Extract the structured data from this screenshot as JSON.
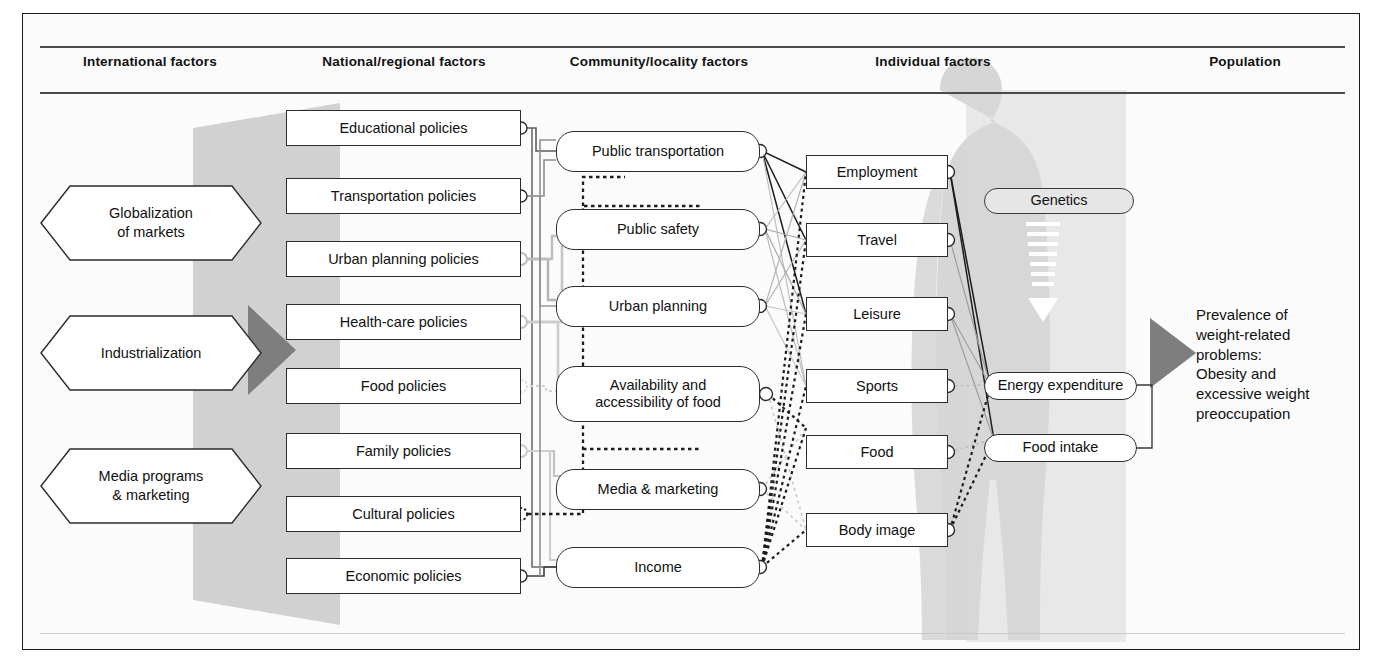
{
  "figure": {
    "type": "flow-diagram"
  },
  "columns": [
    {
      "key": "international",
      "label": "International factors",
      "x": 150
    },
    {
      "key": "national",
      "label": "National/regional factors",
      "x": 404
    },
    {
      "key": "community",
      "label": "Community/locality factors",
      "x": 659
    },
    {
      "key": "individual",
      "label": "Individual factors",
      "x": 933
    },
    {
      "key": "population",
      "label": "Population",
      "x": 1245
    }
  ],
  "international_factors": [
    {
      "label": "Globalization\nof markets",
      "line1": "Globalization",
      "line2": "of markets"
    },
    {
      "label": "Industrialization",
      "line1": "Industrialization",
      "line2": ""
    },
    {
      "label": "Media programs\n& marketing",
      "line1": "Media programs",
      "line2": "& marketing"
    }
  ],
  "national_factors": [
    {
      "label": "Educational policies"
    },
    {
      "label": "Transportation policies"
    },
    {
      "label": "Urban planning policies"
    },
    {
      "label": "Health-care policies"
    },
    {
      "label": "Food policies"
    },
    {
      "label": "Family policies"
    },
    {
      "label": "Cultural policies"
    },
    {
      "label": "Economic policies"
    }
  ],
  "community_factors": [
    {
      "label": "Public transportation",
      "line1": "Public transportation",
      "line2": ""
    },
    {
      "label": "Public safety",
      "line1": "Public safety",
      "line2": ""
    },
    {
      "label": "Urban planning",
      "line1": "Urban planning",
      "line2": ""
    },
    {
      "label": "Availability and accessibility of food",
      "line1": "Availability and",
      "line2": "accessibility of food"
    },
    {
      "label": "Media & marketing",
      "line1": "Media & marketing",
      "line2": ""
    },
    {
      "label": "Income",
      "line1": "Income",
      "line2": ""
    }
  ],
  "individual_factors": [
    {
      "label": "Employment"
    },
    {
      "label": "Travel"
    },
    {
      "label": "Leisure"
    },
    {
      "label": "Sports"
    },
    {
      "label": "Food"
    },
    {
      "label": "Body image"
    }
  ],
  "biological_factors": [
    {
      "label": "Genetics"
    },
    {
      "label": "Energy expenditure"
    },
    {
      "label": "Food intake"
    }
  ],
  "outcome": {
    "lines": [
      "Prevalence of",
      "weight-related",
      "problems:",
      "Obesity and",
      "excessive weight",
      "preoccupation"
    ],
    "text": "Prevalence of weight-related problems: Obesity and excessive weight preoccupation"
  },
  "colors": {
    "page_background": "#ffffff",
    "panel_background": "#fbfbfb",
    "frame_border": "#1a1a1a",
    "shadow_band": "#cccccc",
    "silhouette": "#d2d2d2",
    "arrow_dark": "#808080",
    "node_border": "#2b2b2b",
    "node_fill": "#ffffff",
    "text": "#111111",
    "rule": "#4a4a4a"
  },
  "glyphs": {
    "genetics_arrow": "downward-dashed-arrow"
  }
}
